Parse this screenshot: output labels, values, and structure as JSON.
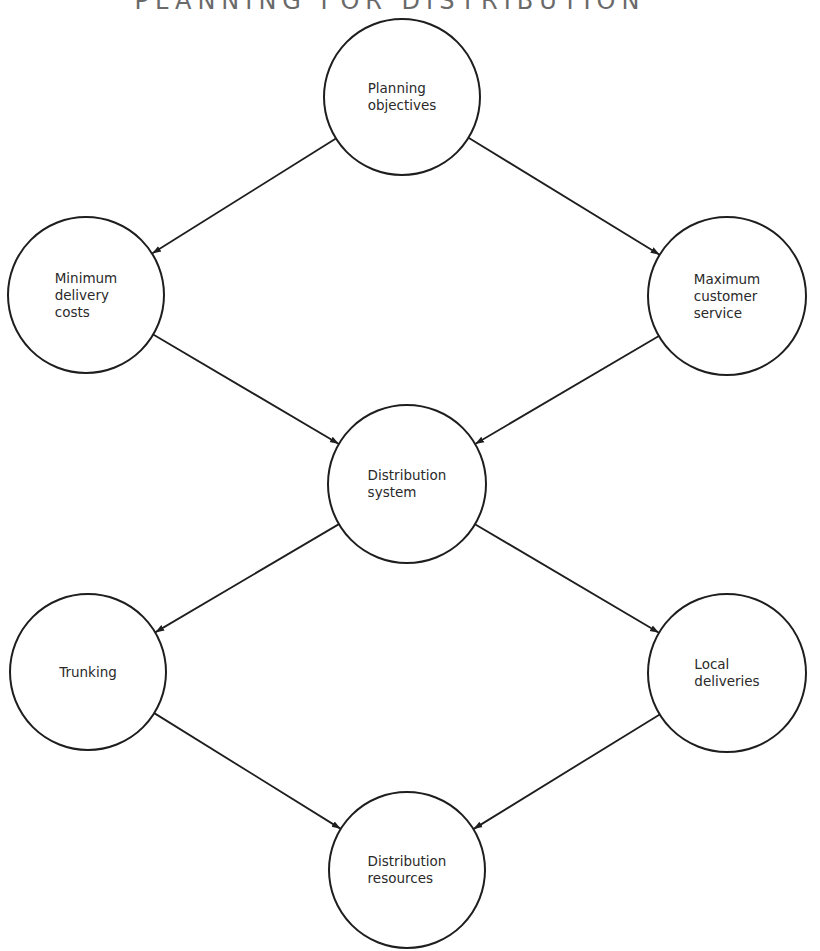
{
  "title": "PLANNING FOR DISTRIBUTION",
  "colors": {
    "stroke": "#1e1e1e",
    "text": "#2a2a2a",
    "background": "#ffffff"
  },
  "nodes": [
    {
      "id": "planning",
      "label": "Planning\nobjectives",
      "cx": 402,
      "cy": 97,
      "r": 78
    },
    {
      "id": "min-cost",
      "label": "Minimum\ndelivery\ncosts",
      "cx": 86,
      "cy": 295,
      "r": 78
    },
    {
      "id": "max-service",
      "label": "Maximum\ncustomer\nservice",
      "cx": 727,
      "cy": 296,
      "r": 79
    },
    {
      "id": "dist-system",
      "label": "Distribution\nsystem",
      "cx": 407,
      "cy": 484,
      "r": 79
    },
    {
      "id": "trunking",
      "label": "Trunking",
      "cx": 88,
      "cy": 672,
      "r": 78
    },
    {
      "id": "local-deliveries",
      "label": "Local\ndeliveries",
      "cx": 727,
      "cy": 673,
      "r": 79
    },
    {
      "id": "dist-resources",
      "label": "Distribution\nresources",
      "cx": 407,
      "cy": 870,
      "r": 78
    }
  ],
  "edges": [
    {
      "from": "planning",
      "to": "min-cost"
    },
    {
      "from": "planning",
      "to": "max-service"
    },
    {
      "from": "min-cost",
      "to": "dist-system"
    },
    {
      "from": "max-service",
      "to": "dist-system"
    },
    {
      "from": "dist-system",
      "to": "trunking"
    },
    {
      "from": "dist-system",
      "to": "local-deliveries"
    },
    {
      "from": "trunking",
      "to": "dist-resources"
    },
    {
      "from": "local-deliveries",
      "to": "dist-resources"
    }
  ]
}
